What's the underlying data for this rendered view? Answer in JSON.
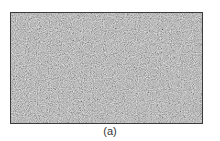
{
  "figure": {
    "panel_label": "(a)",
    "image": {
      "description": "grayscale random noise texture",
      "base_color": "#8c8c8c",
      "border_color": "#3a3a3a"
    }
  }
}
